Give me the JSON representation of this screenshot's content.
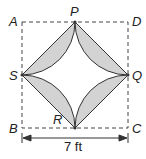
{
  "diagram": {
    "vertices": {
      "A": "A",
      "B": "B",
      "C": "C",
      "D": "D",
      "P": "P",
      "Q": "Q",
      "R": "R",
      "S": "S"
    },
    "dimension_label": "7 ft",
    "colors": {
      "shaded": "#d3d3d3",
      "stroke": "#333333",
      "dashed": "#444444"
    }
  }
}
